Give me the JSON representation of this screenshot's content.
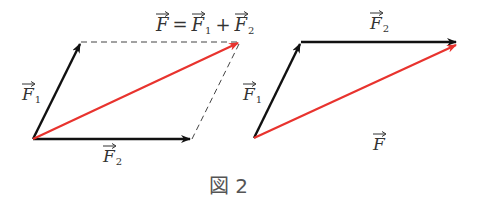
{
  "figure": {
    "caption": "図 2",
    "equation": {
      "lhs": "F",
      "eq": "=",
      "t1": "F",
      "t1_sub": "1",
      "plus": "+",
      "t2": "F",
      "t2_sub": "2"
    },
    "left": {
      "label_f1": {
        "sym": "F",
        "sub": "1"
      },
      "label_f2": {
        "sym": "F",
        "sub": "2"
      }
    },
    "right": {
      "label_f1": {
        "sym": "F",
        "sub": "1"
      },
      "label_f2": {
        "sym": "F",
        "sub": "2"
      },
      "label_f": {
        "sym": "F"
      }
    },
    "colors": {
      "component": "#111111",
      "resultant": "#e8332e",
      "dashed": "#444444",
      "text": "#333333"
    }
  }
}
